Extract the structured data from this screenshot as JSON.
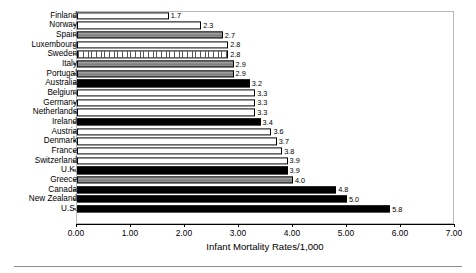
{
  "chart_data": {
    "type": "bar",
    "orientation": "horizontal",
    "title": "",
    "xlabel": "Infant Mortality Rates/1,000",
    "ylabel": "",
    "xlim": [
      0.0,
      7.0
    ],
    "xtick_step": 1.0,
    "xticks": [
      "0.00",
      "1.00",
      "2.00",
      "3.00",
      "4.00",
      "5.00",
      "6.00",
      "7.00"
    ],
    "grid": false,
    "legend": false,
    "categories": [
      "Finland",
      "Norway",
      "Spain",
      "Luxembourg",
      "Sweden",
      "Italy",
      "Portugal",
      "Australia",
      "Belgium",
      "Germany",
      "Netherlands",
      "Ireland",
      "Austria",
      "Denmark",
      "France",
      "Switzerland",
      "U.K.",
      "Greece",
      "Canada",
      "New Zealand",
      "U.S."
    ],
    "values": [
      1.7,
      2.3,
      2.7,
      2.8,
      2.8,
      2.9,
      2.9,
      3.2,
      3.3,
      3.3,
      3.3,
      3.4,
      3.6,
      3.7,
      3.8,
      3.9,
      3.9,
      4.0,
      4.8,
      5.0,
      5.8
    ],
    "value_labels": [
      "1.7",
      "2.3",
      "2.7",
      "2.8",
      "2.8",
      "2.9",
      "2.9",
      "3.2",
      "3.3",
      "3.3",
      "3.3",
      "3.4",
      "3.6",
      "3.7",
      "3.8",
      "3.9",
      "3.9",
      "4.0",
      "4.8",
      "5.0",
      "5.8"
    ],
    "bar_fills": [
      "dotted",
      "dotted",
      "gray",
      "white",
      "hatch",
      "gray",
      "gray",
      "black",
      "white",
      "white",
      "white",
      "black",
      "white",
      "dotted",
      "white",
      "white",
      "black",
      "gray",
      "black",
      "black",
      "black"
    ]
  },
  "colors": {
    "bar_black": "#000000",
    "bar_white": "#ffffff",
    "bar_gray": "#9a9a9a",
    "axis": "#000000",
    "plot_border": "#b9b9b9",
    "rule": "#8e8e8e",
    "text": "#000000"
  }
}
